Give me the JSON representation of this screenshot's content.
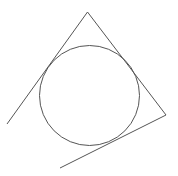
{
  "figure": {
    "stroke_color": "#555555",
    "background_color": "#ffffff",
    "shapes": [
      {
        "name": "inscribed-circle",
        "type": "circle"
      },
      {
        "name": "tangent-line-left",
        "type": "line"
      },
      {
        "name": "tangent-line-right",
        "type": "line"
      },
      {
        "name": "tangent-line-bottom",
        "type": "line"
      }
    ]
  }
}
